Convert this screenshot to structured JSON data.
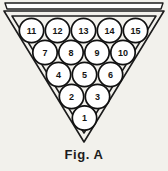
{
  "figure": {
    "caption": "Fig. A",
    "background_color": "#f2f1ec",
    "line_color": "#1c1c1c",
    "ball_fill": "#ffffff",
    "ball_outline": "#111111"
  },
  "rack": {
    "shape": "inverted-triangle",
    "top_rail": true,
    "frame_style": "double-line"
  },
  "balls": {
    "rows": [
      {
        "row_index": 1,
        "count": 5,
        "numbers": [
          "11",
          "12",
          "13",
          "14",
          "15"
        ]
      },
      {
        "row_index": 2,
        "count": 4,
        "numbers": [
          "7",
          "8",
          "9",
          "10"
        ]
      },
      {
        "row_index": 3,
        "count": 3,
        "numbers": [
          "4",
          "5",
          "6"
        ]
      },
      {
        "row_index": 4,
        "count": 2,
        "numbers": [
          "2",
          "3"
        ]
      },
      {
        "row_index": 5,
        "count": 1,
        "numbers": [
          "1"
        ]
      }
    ],
    "total": 15
  }
}
